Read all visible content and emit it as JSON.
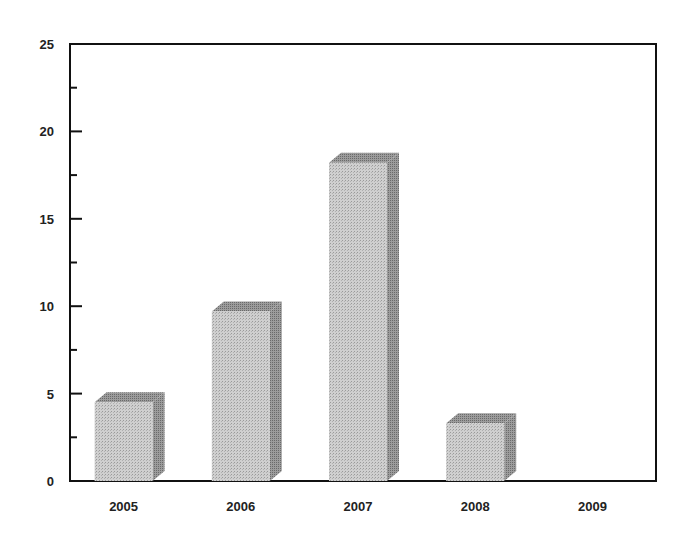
{
  "chart_data": {
    "type": "bar",
    "style": "3d-shaded-bars",
    "title": "",
    "xlabel": "",
    "ylabel": "",
    "categories": [
      "2005",
      "2006",
      "2007",
      "2008",
      "2009"
    ],
    "values": [
      4.5,
      9.7,
      18.2,
      3.3,
      0
    ],
    "ylim": [
      0,
      25
    ],
    "yticks_major": [
      0,
      5,
      10,
      15,
      20,
      25
    ],
    "yticks_minor": [
      2.5,
      7.5,
      12.5,
      17.5,
      22.5
    ],
    "grid": false,
    "legend": null,
    "colors": {
      "bar_front": "#c4c4c4",
      "bar_top": "#8a8a8a",
      "bar_side": "#8f8f8f",
      "axis": "#111111"
    }
  }
}
